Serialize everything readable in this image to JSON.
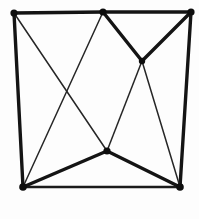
{
  "figure": {
    "background_color": "#fdfdfd",
    "ink_color": "#141414",
    "width": 199,
    "height": 219
  },
  "chart_data": {
    "type": "diagram",
    "vertices": [
      {
        "id": "tl",
        "label": "top-left-corner",
        "x": 14,
        "y": 13,
        "radius": 3.6
      },
      {
        "id": "tm",
        "label": "top-middle",
        "x": 103,
        "y": 12,
        "radius": 3.6
      },
      {
        "id": "tr",
        "label": "top-right-corner",
        "x": 191,
        "y": 12,
        "radius": 3.6
      },
      {
        "id": "ci",
        "label": "upper-interior",
        "x": 142,
        "y": 61,
        "radius": 3.2
      },
      {
        "id": "cl",
        "label": "lower-center",
        "x": 107,
        "y": 151,
        "radius": 3.6
      },
      {
        "id": "bl",
        "label": "bottom-left-corner",
        "x": 23,
        "y": 187,
        "radius": 3.8
      },
      {
        "id": "br",
        "label": "bottom-right-corner",
        "x": 180,
        "y": 187,
        "radius": 3.8
      }
    ],
    "edges": [
      {
        "from": "tl",
        "to": "tm",
        "weight": "thick",
        "note": "top edge left half"
      },
      {
        "from": "tm",
        "to": "tr",
        "weight": "thick",
        "note": "top edge right half"
      },
      {
        "from": "tl",
        "to": "bl",
        "weight": "thick",
        "note": "left edge"
      },
      {
        "from": "tr",
        "to": "br",
        "weight": "thick",
        "note": "right edge"
      },
      {
        "from": "bl",
        "to": "br",
        "weight": "medium",
        "note": "bottom edge"
      },
      {
        "from": "tm",
        "to": "ci",
        "weight": "thick",
        "note": "upper-left arm of V"
      },
      {
        "from": "tr",
        "to": "ci",
        "weight": "thick",
        "note": "upper-right arm of V"
      },
      {
        "from": "bl",
        "to": "cl",
        "weight": "thick",
        "note": "lower-left arm of V"
      },
      {
        "from": "br",
        "to": "cl",
        "weight": "thick",
        "note": "lower-right arm of V"
      },
      {
        "from": "tl",
        "to": "cl",
        "weight": "thin",
        "note": "chord crossing down-right"
      },
      {
        "from": "tm",
        "to": "bl",
        "weight": "thin",
        "note": "chord crossing down-left"
      },
      {
        "from": "ci",
        "to": "cl",
        "weight": "thin",
        "note": "interior connector"
      },
      {
        "from": "ci",
        "to": "br",
        "weight": "thin",
        "note": "interior to bottom-right"
      }
    ],
    "crossings": [
      {
        "x": 70,
        "y": 92,
        "between": [
          "tl-cl",
          "tm-bl"
        ]
      },
      {
        "x": 131,
        "y": 131,
        "between": [
          "ci-cl",
          "ci-br"
        ]
      }
    ],
    "vertex_count": 7,
    "edge_count": 13,
    "grid": false,
    "legend": "none",
    "axis_labels": "none"
  }
}
